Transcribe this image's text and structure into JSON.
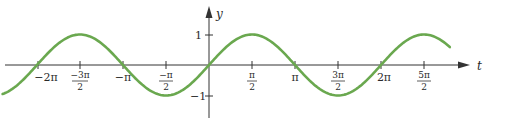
{
  "chart_data": {
    "type": "line",
    "title": "",
    "xlabel": "t",
    "ylabel": "y",
    "function": "sin(t)",
    "xlim": [
      -2.4,
      2.8
    ],
    "xlim_units": "pi",
    "ylim": [
      -1,
      1
    ],
    "grid": false,
    "legend": null,
    "x_ticks": [
      "-2π",
      "-3π/2",
      "-π",
      "-π/2",
      "π/2",
      "π",
      "3π/2",
      "2π",
      "5π/2"
    ],
    "x_tick_values_pi": [
      -2,
      -1.5,
      -1,
      -0.5,
      0.5,
      1,
      1.5,
      2,
      2.5
    ],
    "y_ticks": [
      "1",
      "-1"
    ],
    "y_tick_values": [
      1,
      -1
    ],
    "series": [
      {
        "name": "y = sin t",
        "color": "#6aa84f",
        "x_pi": [
          -2.4,
          -2.0,
          -1.5,
          -1.0,
          -0.5,
          0.0,
          0.5,
          1.0,
          1.5,
          2.0,
          2.5,
          2.8
        ],
        "y": [
          -0.95,
          0.0,
          1.0,
          0.0,
          -1.0,
          0.0,
          1.0,
          0.0,
          -1.0,
          0.0,
          1.0,
          0.59
        ]
      }
    ]
  },
  "labels": {
    "y_axis": "y",
    "t_axis": "t",
    "y_one": "1",
    "y_neg_one": "−1",
    "neg_two_pi": "−2π",
    "neg_three_pi_num": "−3π",
    "neg_three_pi_den": "2",
    "neg_pi": "−π",
    "neg_half_pi_num": "−π",
    "neg_half_pi_den": "2",
    "half_pi_num": "π",
    "half_pi_den": "2",
    "pi": "π",
    "three_half_pi_num": "3π",
    "three_half_pi_den": "2",
    "two_pi": "2π",
    "five_half_pi_num": "5π",
    "five_half_pi_den": "2"
  },
  "colors": {
    "curve": "#6aa84f",
    "axis": "#333333"
  }
}
